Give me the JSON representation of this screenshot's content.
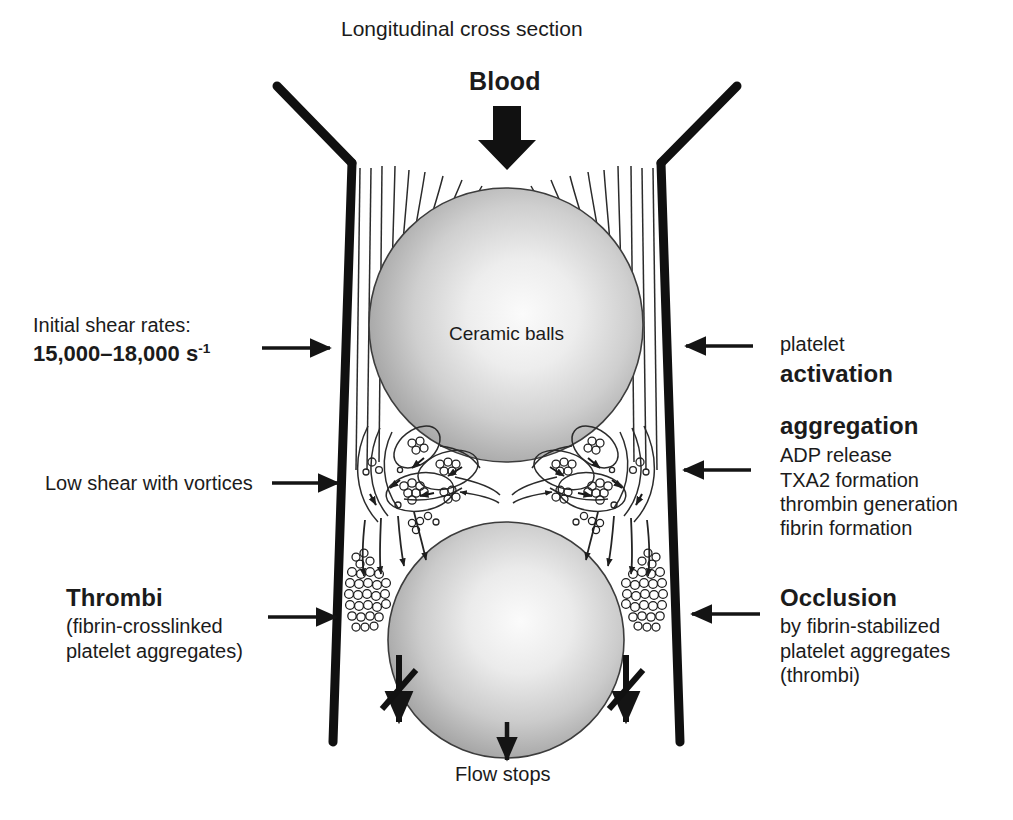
{
  "diagram": {
    "title": "Longitudinal cross section",
    "inlet_label": "Blood",
    "ball_label": "Ceramic balls",
    "outlet_label": "Flow stops"
  },
  "left_annotations": {
    "shear": {
      "line1": "Initial shear rates:",
      "value_main": "15,000–18,000 s",
      "value_sup": "-1"
    },
    "vortices": {
      "line1": "Low shear with vortices"
    },
    "thrombi": {
      "heading": "Thrombi",
      "line1": "(fibrin-crosslinked",
      "line2": "platelet aggregates)"
    }
  },
  "right_annotations": {
    "platelet": {
      "line1": "platelet",
      "heading": "activation"
    },
    "aggregation": {
      "heading": "aggregation",
      "line1": "ADP release",
      "line2": "TXA2 formation",
      "line3": "thrombin generation",
      "line4": "fibrin formation"
    },
    "occlusion": {
      "heading": "Occlusion",
      "line1": "by fibrin-stabilized",
      "line2": "platelet aggregates",
      "line3": "(thrombi)"
    }
  },
  "colors": {
    "ink": "#1b1b1b",
    "wall": "#111111",
    "ball_light": "#f2f2f2",
    "ball_mid": "#b9b9b9",
    "ball_dark": "#6f6f6f",
    "streamline": "#2a2a2a",
    "background": "#ffffff"
  },
  "icons": {
    "inlet_arrow": "thick-down-arrow",
    "outlet_arrow": "down-arrow",
    "pointer_right": "right-arrow",
    "pointer_left": "left-arrow",
    "blocked_flow": "crossed-down-arrow"
  }
}
